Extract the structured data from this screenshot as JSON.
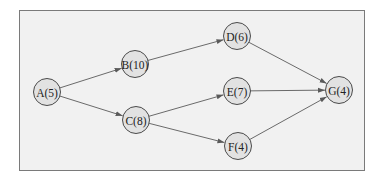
{
  "diagram": {
    "type": "directed-network",
    "colors": {
      "page_background": "#ffffff",
      "frame_background": "#f1f1f1",
      "frame_border": "#7a7a7a",
      "node_fill": "#e2e2e2",
      "node_stroke": "#4a4a4a",
      "edge": "#6a6a6a",
      "text": "#222222"
    },
    "nodes": [
      {
        "id": "A",
        "label": "A(5)",
        "duration": 5,
        "cx": 47,
        "cy": 92
      },
      {
        "id": "B",
        "label": "B(10)",
        "duration": 10,
        "cx": 135,
        "cy": 64
      },
      {
        "id": "C",
        "label": "C(8)",
        "duration": 8,
        "cx": 136,
        "cy": 120
      },
      {
        "id": "D",
        "label": "D(6)",
        "duration": 6,
        "cx": 237,
        "cy": 36
      },
      {
        "id": "E",
        "label": "E(7)",
        "duration": 7,
        "cx": 237,
        "cy": 91
      },
      {
        "id": "F",
        "label": "F(4)",
        "duration": 4,
        "cx": 238,
        "cy": 146
      },
      {
        "id": "G",
        "label": "G(4)",
        "duration": 4,
        "cx": 339,
        "cy": 90
      }
    ],
    "edges": [
      {
        "from": "A",
        "to": "B"
      },
      {
        "from": "A",
        "to": "C"
      },
      {
        "from": "B",
        "to": "D"
      },
      {
        "from": "C",
        "to": "E"
      },
      {
        "from": "C",
        "to": "F"
      },
      {
        "from": "D",
        "to": "G"
      },
      {
        "from": "E",
        "to": "G"
      },
      {
        "from": "F",
        "to": "G"
      }
    ]
  }
}
